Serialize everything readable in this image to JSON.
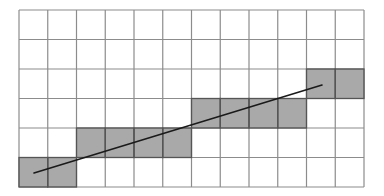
{
  "diagram": {
    "type": "pixel-grid-line-rasterization",
    "grid": {
      "columns": 12,
      "rows": 6,
      "left": 19,
      "top": 10,
      "right": 364,
      "bottom": 187,
      "line_color": "#8c8c8c",
      "background": "#ffffff"
    },
    "shaded_cells": [
      {
        "col": 0,
        "row": 5
      },
      {
        "col": 1,
        "row": 5
      },
      {
        "col": 2,
        "row": 4
      },
      {
        "col": 3,
        "row": 4
      },
      {
        "col": 4,
        "row": 4
      },
      {
        "col": 5,
        "row": 4
      },
      {
        "col": 6,
        "row": 3
      },
      {
        "col": 7,
        "row": 3
      },
      {
        "col": 8,
        "row": 3
      },
      {
        "col": 9,
        "row": 3
      },
      {
        "col": 10,
        "row": 2
      },
      {
        "col": 11,
        "row": 2
      }
    ],
    "shade_color": "#a9a9a9",
    "shade_border_color": "#555555",
    "line": {
      "x1": 34,
      "y1": 173,
      "x2": 322,
      "y2": 85,
      "color": "#1a1a1a",
      "width": 1.6
    }
  }
}
